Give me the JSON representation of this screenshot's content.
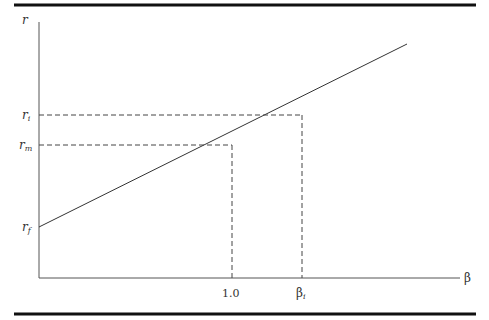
{
  "diagram": {
    "axes": {
      "y_label": "r",
      "x_label": "β"
    },
    "y_ticks": [
      {
        "base": "r",
        "sub": "i"
      },
      {
        "base": "r",
        "sub": "m"
      },
      {
        "base": "r",
        "sub": "f"
      }
    ],
    "x_ticks": [
      {
        "base": "1.0",
        "sub": ""
      },
      {
        "base": "β",
        "sub": "i"
      }
    ],
    "colors": {
      "rule": "#111111",
      "axis": "#555555",
      "line": "#333333",
      "dash": "#444444"
    }
  }
}
